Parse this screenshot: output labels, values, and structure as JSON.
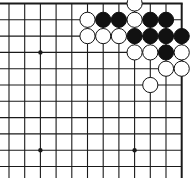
{
  "diagram": {
    "type": "go-board-fragment",
    "corner": "top-right",
    "grid": {
      "columns_x": [
        9,
        24.7,
        40.4,
        56.1,
        71.8,
        87.5,
        103.2,
        118.9,
        134.6,
        150.3,
        166,
        181.7
      ],
      "rows_y": [
        3.5,
        19.8,
        36.1,
        52.4,
        68.7,
        85,
        101.3,
        117.6,
        133.9,
        150.2,
        166.5
      ],
      "right_edge_col": 11,
      "top_edge_row": 0,
      "line_color": "#1a1a1a",
      "background": "#ffffff"
    },
    "star_points": [
      {
        "col": 2,
        "row": 3
      },
      {
        "col": 2,
        "row": 9
      },
      {
        "col": 8,
        "row": 9
      }
    ],
    "stones": [
      {
        "color": "white",
        "col": 8,
        "row": 0
      },
      {
        "color": "white",
        "col": 5,
        "row": 1
      },
      {
        "color": "black",
        "col": 6,
        "row": 1
      },
      {
        "color": "black",
        "col": 7,
        "row": 1
      },
      {
        "color": "white",
        "col": 8,
        "row": 1
      },
      {
        "color": "black",
        "col": 9,
        "row": 1
      },
      {
        "color": "black",
        "col": 10,
        "row": 1
      },
      {
        "color": "white",
        "col": 5,
        "row": 2
      },
      {
        "color": "white",
        "col": 6,
        "row": 2
      },
      {
        "color": "white",
        "col": 7,
        "row": 2
      },
      {
        "color": "black",
        "col": 8,
        "row": 2
      },
      {
        "color": "black",
        "col": 9,
        "row": 2
      },
      {
        "color": "black",
        "col": 10,
        "row": 2
      },
      {
        "color": "black",
        "col": 11,
        "row": 2
      },
      {
        "color": "white",
        "col": 8,
        "row": 3
      },
      {
        "color": "white",
        "col": 9,
        "row": 3
      },
      {
        "color": "black",
        "col": 10,
        "row": 3
      },
      {
        "color": "white",
        "col": 11,
        "row": 3
      },
      {
        "color": "white",
        "col": 10,
        "row": 4
      },
      {
        "color": "white",
        "col": 11,
        "row": 4
      },
      {
        "color": "white",
        "col": 9,
        "row": 5
      }
    ],
    "stone_radius": 7.6
  }
}
